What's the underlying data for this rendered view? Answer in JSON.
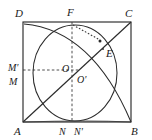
{
  "figure": {
    "kind": "geometry-diagram",
    "background_color": "#ffffff",
    "line_color": "#2b2b2b",
    "square": {
      "corner_labels": {
        "top_left": "D",
        "top_right": "C",
        "bottom_left": "A",
        "bottom_right": "B"
      },
      "pixel_corners": {
        "top_left": [
          23,
          22
        ],
        "top_right": [
          131,
          22
        ],
        "bottom_left": [
          23,
          122
        ],
        "bottom_right": [
          131,
          122
        ]
      }
    },
    "points": [
      {
        "label": "D",
        "x": 23,
        "y": 22,
        "label_x": 15,
        "label_y": 14
      },
      {
        "label": "C",
        "x": 131,
        "y": 22,
        "label_x": 127,
        "label_y": 13
      },
      {
        "label": "A",
        "x": 23,
        "y": 122,
        "label_x": 14,
        "label_y": 133
      },
      {
        "label": "B",
        "x": 131,
        "y": 122,
        "label_x": 131,
        "label_y": 133
      },
      {
        "label": "F",
        "x": 72,
        "y": 22,
        "label_x": 67,
        "label_y": 14
      },
      {
        "label": "E",
        "x": 103,
        "y": 49,
        "label_x": 107,
        "label_y": 54
      },
      {
        "label": "O",
        "x": 72,
        "y": 70,
        "label_x": 64,
        "label_y": 71
      },
      {
        "label": "O'",
        "x": 77,
        "y": 76,
        "label_x": 78,
        "label_y": 81
      },
      {
        "label": "M'",
        "x": 23,
        "y": 67,
        "label_x": 10,
        "label_y": 69
      },
      {
        "label": "M",
        "x": 23,
        "y": 79,
        "label_x": 11,
        "label_y": 82
      },
      {
        "label": "N",
        "x": 64,
        "y": 122,
        "label_x": 60,
        "label_y": 133
      },
      {
        "label": "N'",
        "x": 77,
        "y": 122,
        "label_x": 76,
        "label_y": 133
      }
    ],
    "labels": {
      "D": "D",
      "C": "C",
      "A": "A",
      "B": "B",
      "F": "F",
      "E": "E",
      "O": "O",
      "O_prime": "O'",
      "M_prime": "M'",
      "M": "M",
      "N": "N",
      "N_prime": "N'"
    },
    "elements": {
      "square_outline": "square ABCD",
      "diagonal": "diagonal A to C passing through O, O' and E",
      "inscribed_circle": "circle centered at O' through F, M, N",
      "arc_D_to_B": "quarter arc from near D curving to B",
      "arc_A_to_B": "arc from A sweeping to B",
      "dashed_horizontal": "dashed segment M' to O and beyond",
      "dashed_vertical": "dashed segment F through O' down to N'",
      "dotted_tangent": "short dotted segment from F toward E"
    }
  }
}
